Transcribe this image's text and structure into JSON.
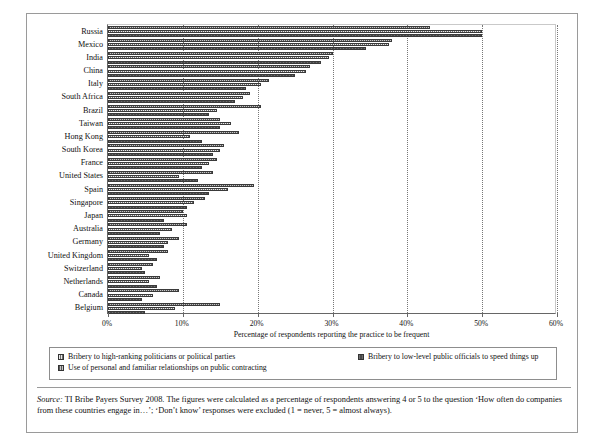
{
  "chart_data": {
    "type": "bar",
    "orientation": "horizontal-grouped",
    "title": "",
    "xlabel": "Percentage of respondents reporting the practice to be frequent",
    "ylabel": "",
    "xlim": [
      0,
      60
    ],
    "xticks": [
      0,
      10,
      20,
      30,
      40,
      50,
      60
    ],
    "xtick_labels": [
      "0%",
      "10%",
      "20%",
      "30%",
      "40%",
      "50%",
      "60%"
    ],
    "grid": "vertical-dotted",
    "legend_position": "below-axis",
    "categories": [
      "Russia",
      "Mexico",
      "India",
      "China",
      "Italy",
      "South Africa",
      "Brazil",
      "Taiwan",
      "Hong Kong",
      "South Korea",
      "France",
      "United States",
      "Spain",
      "Singapore",
      "Japan",
      "Australia",
      "Germany",
      "United Kingdom",
      "Switzerland",
      "Netherlands",
      "Canada",
      "Belgium"
    ],
    "series": [
      {
        "name": "Use of personal and familiar relationships on public contracting",
        "key": "s2",
        "color": "#c6c6c6",
        "values": [
          43.0,
          38.0,
          30.0,
          27.0,
          21.5,
          19.0,
          20.5,
          15.0,
          17.5,
          15.5,
          14.5,
          14.0,
          19.5,
          13.0,
          10.0,
          10.5,
          9.5,
          8.0,
          6.0,
          7.0,
          9.5,
          15.0
        ]
      },
      {
        "name": "Bribery to high-ranking politicians or political parties",
        "key": "s0",
        "color": "#6e6e6e",
        "values": [
          50.0,
          37.5,
          29.5,
          26.5,
          20.5,
          18.0,
          14.5,
          16.5,
          11.0,
          15.0,
          13.5,
          9.5,
          16.0,
          11.5,
          10.5,
          8.5,
          8.0,
          5.5,
          4.5,
          5.5,
          6.0,
          9.0
        ]
      },
      {
        "name": "Bribery to low-level public officials to speed things up",
        "key": "s1",
        "color": "#4a4a4a",
        "values": [
          50.0,
          34.5,
          28.5,
          25.0,
          18.5,
          17.0,
          13.5,
          15.0,
          12.5,
          14.0,
          12.5,
          12.0,
          13.5,
          10.5,
          7.5,
          7.0,
          7.5,
          6.5,
          5.0,
          6.5,
          4.5,
          5.0
        ]
      }
    ]
  },
  "legend": {
    "items": [
      {
        "label": "Bribery to high-ranking politicians or political parties",
        "key": "s0"
      },
      {
        "label": "Bribery to low-level public officials to speed things up",
        "key": "s1"
      },
      {
        "label": "Use of personal and familiar relationships on public contracting",
        "key": "s2"
      }
    ]
  },
  "source_note": {
    "label": "Source:",
    "text": " TI Bribe Payers Survey 2008. The figures were calculated as a percentage of respondents answering 4 or 5 to the question ‘How often do companies from these countries engage in…’; ‘Don’t know’ responses were excluded (1 = never, 5 = almost always)."
  }
}
